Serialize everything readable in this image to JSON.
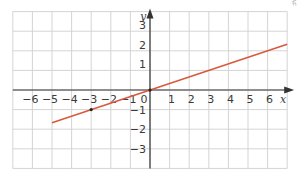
{
  "chart_data": {
    "type": "line",
    "title": "",
    "xlabel": "x",
    "ylabel": "y",
    "xlim": [
      -7,
      7
    ],
    "ylim": [
      -4,
      4
    ],
    "grid": true,
    "x_ticks": [
      -6,
      -5,
      -4,
      -3,
      -2,
      -1,
      0,
      1,
      2,
      3,
      4,
      5,
      6
    ],
    "y_ticks": [
      -3,
      -2,
      -1,
      1,
      2,
      3
    ],
    "x_tick_labels": [
      "−6",
      "−5",
      "−4",
      "−3",
      "−2",
      "−1",
      "0",
      "1",
      "2",
      "3",
      "4",
      "5",
      "6"
    ],
    "y_tick_labels": [
      "−3",
      "−2",
      "−1",
      "1",
      "2",
      "3"
    ],
    "series": [
      {
        "name": "y = x/3",
        "color": "#d9583b",
        "x": [
          -5,
          7
        ],
        "values": [
          -1.667,
          2.333
        ]
      }
    ],
    "points": [
      {
        "x": -3,
        "y": -1,
        "color": "#222222"
      },
      {
        "x": 0,
        "y": 0,
        "color": "#222222"
      }
    ]
  },
  "credit": "DAF",
  "colors": {
    "grid": "#d4d4d4",
    "axis": "#333333",
    "line": "#d9583b"
  }
}
